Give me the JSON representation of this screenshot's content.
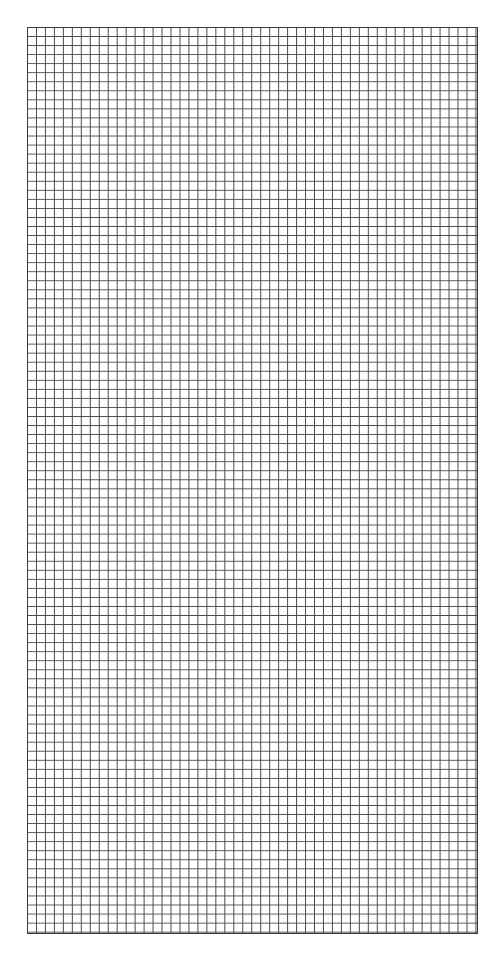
{
  "sheet": {
    "type": "grid-paper",
    "columns": 50,
    "rows": 100,
    "line_color": "#4a4a4a",
    "border_color": "#3a3a3a",
    "background_color": "#ffffff"
  }
}
